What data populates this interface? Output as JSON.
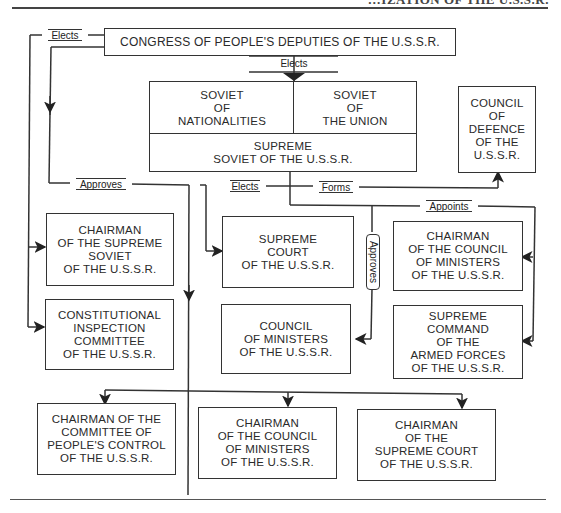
{
  "page_header": {
    "partial_title": "…IZATION OF THE U.S.S.R."
  },
  "boxes": {
    "congress": "CONGRESS OF PEOPLE'S DEPUTIES OF THE U.S.S.R.",
    "soviet_nationalities": "SOVIET\nOF\nNATIONALITIES",
    "soviet_union": "SOVIET\nOF\nTHE UNION",
    "supreme_soviet": "SUPREME\nSOVIET OF THE U.S.S.R.",
    "council_defence": "COUNCIL\nOF\nDEFENCE\nOF THE\nU.S.S.R.",
    "chairman_supreme_soviet": "CHAIRMAN\nOF THE SUPREME\nSOVIET\nOF THE U.S.S.R.",
    "constitutional_committee": "CONSTITUTIONAL\nINSPECTION\nCOMMITTEE\nOF THE U.S.S.R.",
    "supreme_court": "SUPREME\nCOURT\nOF THE U.S.S.R.",
    "council_ministers": "COUNCIL\nOF MINISTERS\nOF THE U.S.S.R.",
    "chairman_council_ministers_right": "CHAIRMAN\nOF THE COUNCIL\nOF MINISTERS\nOF THE U.S.S.R.",
    "supreme_command": "SUPREME\nCOMMAND\nOF THE\nARMED FORCES\nOF THE U.S.S.R.",
    "chairman_peoples_control": "CHAIRMAN OF THE\nCOMMITTEE OF\nPEOPLE'S CONTROL\nOF THE U.S.S.R.",
    "chairman_council_ministers_bottom": "CHAIRMAN\nOF THE COUNCIL\nOF MINISTERS\nOF THE U.S.S.R.",
    "chairman_supreme_court": "CHAIRMAN\nOF THE\nSUPREME COURT\nOF THE U.S.S.R."
  },
  "labels": {
    "elects_top_left": "Elects",
    "elects_center": "Elects",
    "approves_left": "Approves",
    "elects_mid": "Elects",
    "forms": "Forms",
    "appoints": "Appoints",
    "approves_vertical": "Approves"
  },
  "colors": {
    "line": "#333333",
    "text": "#2a2a2a",
    "background": "#ffffff"
  }
}
